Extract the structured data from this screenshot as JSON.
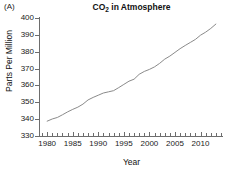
{
  "panel": {
    "letter": "(A)"
  },
  "axis_labels": {
    "x": "Year",
    "y": "Parts Per Million"
  },
  "chart_data": {
    "type": "line",
    "title": "CO2 in Atmosphere",
    "title_parts": {
      "prefix": "CO",
      "sub": "2",
      "suffix": " in Atmosphere"
    },
    "xlabel": "Year",
    "ylabel": "Parts Per Million",
    "xlim": [
      1978.6,
      2014.2
    ],
    "ylim": [
      330,
      400
    ],
    "grid": false,
    "legend": null,
    "line_color": "#8a8a8a",
    "xticks_major": [
      1980,
      1985,
      1990,
      1995,
      2000,
      2005,
      2010
    ],
    "xtick_labels": [
      "1980",
      "1985",
      "1990",
      "1995",
      "2000",
      "2005",
      "2010"
    ],
    "xticks_minor_step": 1,
    "yticks": [
      330,
      340,
      350,
      360,
      370,
      380,
      390,
      400
    ],
    "ytick_labels": [
      "330",
      "340",
      "350",
      "360",
      "370",
      "380",
      "390",
      "400"
    ],
    "series": [
      {
        "name": "Atmospheric CO2",
        "x": [
          1980,
          1981,
          1982,
          1983,
          1984,
          1985,
          1986,
          1987,
          1988,
          1989,
          1990,
          1991,
          1992,
          1993,
          1994,
          1995,
          1996,
          1997,
          1998,
          1999,
          2000,
          2001,
          2002,
          2003,
          2004,
          2005,
          2006,
          2007,
          2008,
          2009,
          2010,
          2011,
          2012,
          2013
        ],
        "values": [
          338.8,
          340.1,
          341.0,
          342.6,
          344.3,
          345.8,
          347.1,
          348.9,
          351.4,
          352.9,
          354.2,
          355.5,
          356.2,
          356.9,
          358.7,
          360.6,
          362.5,
          363.7,
          366.6,
          368.3,
          369.5,
          371.0,
          373.1,
          375.6,
          377.4,
          379.6,
          381.8,
          383.7,
          385.5,
          387.3,
          389.8,
          391.6,
          393.8,
          396.4
        ]
      }
    ]
  }
}
